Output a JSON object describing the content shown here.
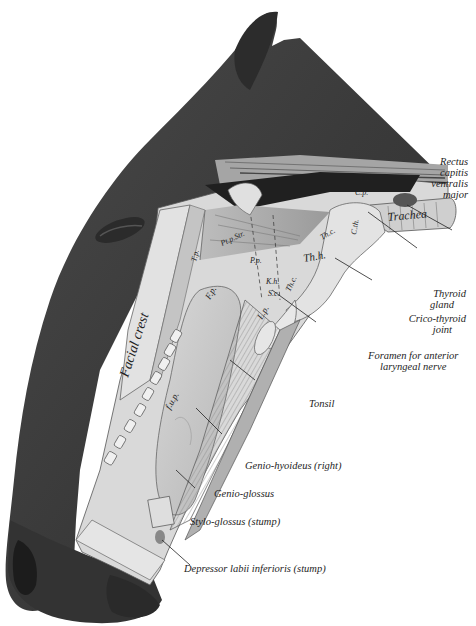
{
  "figure": {
    "colors": {
      "background": "#ffffff",
      "skin": "#3d3d3d",
      "skin_dark": "#2a2a2a",
      "tissue": "#cfcfcf",
      "tissue_light": "#e6e6e6",
      "line": "#222222"
    }
  },
  "labels": {
    "rectus": [
      "Rectus",
      "capitis",
      "ventralis",
      "major"
    ],
    "thyroid_gland": [
      "Thyroid",
      "gland"
    ],
    "crico_thyroid": [
      "Crico-thyroid",
      "joint"
    ],
    "foramen": [
      "Foramen for anterior",
      "laryngeal nerve"
    ],
    "tonsil": "Tonsil",
    "genio_hyoideus": "Genio-hyoideus (right)",
    "genio_glossus": "Genio-glossus",
    "stylo_glossus": "Stylo-glossus (stump)",
    "depressor": "Depressor labii inferioris (stump)"
  },
  "inline_labels": {
    "facial_crest": "Facial crest",
    "trachea": "Trachea",
    "oes": "Oes.",
    "cp": "C.p.",
    "thc1": "Th.c.",
    "thc2": "Th.c.",
    "thh": "Th.h.",
    "ctm": "C.th.",
    "kh": "K.h.",
    "sc": "S.c.",
    "lp": "L.p.",
    "fp": "F.p.",
    "fup": "f.u.p.",
    "tp": "T.p.",
    "ptpstr": "Pt.p.Str.",
    "pip": "P.p."
  }
}
